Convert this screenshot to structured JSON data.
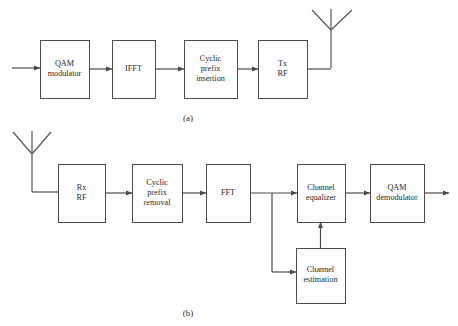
{
  "figure": {
    "background_color": "#ffffff",
    "line_color": "#4a4a4a",
    "text_color": "#2b2b2b",
    "box_fill": "#fdfdfd"
  },
  "captions": {
    "a": "(a)",
    "b": "(b)"
  },
  "diagram_a": {
    "name": "transmitter-chain",
    "caption": "(a)",
    "blocks": [
      {
        "id": "qam-modulator",
        "lines": [
          "QAM",
          "modulator"
        ],
        "x": 40,
        "y": 40,
        "w": 49,
        "h": 58
      },
      {
        "id": "ifft",
        "lines": [
          "IFFT"
        ],
        "x": 112,
        "y": 40,
        "w": 43,
        "h": 58
      },
      {
        "id": "cyclic-prefix-insertion",
        "lines": [
          "Cyclic",
          "prefix",
          "insertion"
        ],
        "x": 184,
        "y": 40,
        "w": 53,
        "h": 58
      },
      {
        "id": "tx-rf",
        "lines": [
          "Tx",
          "RF"
        ],
        "x": 258,
        "y": 40,
        "w": 49,
        "h": 58
      }
    ],
    "antenna": {
      "id": "tx-antenna",
      "mast_x": 331,
      "top_y": 9,
      "vertex_y": 30,
      "base_y": 68,
      "left_tip_x": 312,
      "right_tip_x": 352
    },
    "input_arrow": {
      "from_x": 12,
      "to_x": 40,
      "y": 68
    }
  },
  "diagram_b": {
    "name": "receiver-chain",
    "caption": "(b)",
    "blocks": [
      {
        "id": "rx-rf",
        "lines": [
          "Rx",
          "RF"
        ],
        "x": 58,
        "y": 164,
        "w": 47,
        "h": 58
      },
      {
        "id": "cyclic-prefix-removal",
        "lines": [
          "Cyclic",
          "prefix",
          "removal"
        ],
        "x": 132,
        "y": 164,
        "w": 50,
        "h": 58
      },
      {
        "id": "fft",
        "lines": [
          "FFT"
        ],
        "x": 206,
        "y": 164,
        "w": 44,
        "h": 58
      },
      {
        "id": "channel-equalizer",
        "lines": [
          "Channel",
          "equalizer"
        ],
        "x": 297,
        "y": 164,
        "w": 48,
        "h": 58
      },
      {
        "id": "qam-demodulator",
        "lines": [
          "QAM",
          "demodulator"
        ],
        "x": 370,
        "y": 164,
        "w": 54,
        "h": 58
      },
      {
        "id": "channel-estimation",
        "lines": [
          "Channel",
          "estimation"
        ],
        "x": 296,
        "y": 248,
        "w": 49,
        "h": 55
      }
    ],
    "antenna": {
      "id": "rx-antenna",
      "mast_x": 32,
      "top_y": 131,
      "vertex_y": 154,
      "base_y": 192,
      "left_tip_x": 13,
      "right_tip_x": 51
    },
    "branch": {
      "x": 272,
      "from_y": 193,
      "to_y": 272
    },
    "output_arrow": {
      "from_x": 424,
      "to_x": 449,
      "y": 193
    }
  },
  "flow_a": [
    {
      "from": "input",
      "to": "qam-modulator"
    },
    {
      "from": "qam-modulator",
      "to": "ifft"
    },
    {
      "from": "ifft",
      "to": "cyclic-prefix-insertion"
    },
    {
      "from": "cyclic-prefix-insertion",
      "to": "tx-rf"
    },
    {
      "from": "tx-rf",
      "to": "tx-antenna"
    }
  ],
  "flow_b": [
    {
      "from": "rx-antenna",
      "to": "rx-rf"
    },
    {
      "from": "rx-rf",
      "to": "cyclic-prefix-removal"
    },
    {
      "from": "cyclic-prefix-removal",
      "to": "fft"
    },
    {
      "from": "fft",
      "to": "channel-equalizer"
    },
    {
      "from": "fft",
      "to": "channel-estimation"
    },
    {
      "from": "channel-estimation",
      "to": "channel-equalizer"
    },
    {
      "from": "channel-equalizer",
      "to": "qam-demodulator"
    },
    {
      "from": "qam-demodulator",
      "to": "output"
    }
  ]
}
